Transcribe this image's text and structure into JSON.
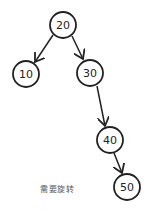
{
  "diagram": {
    "type": "binary-search-tree",
    "nodes": [
      {
        "id": "n20",
        "label": "20",
        "cx": 63,
        "cy": 25
      },
      {
        "id": "n10",
        "label": "10",
        "cx": 26,
        "cy": 74
      },
      {
        "id": "n30",
        "label": "30",
        "cx": 90,
        "cy": 73
      },
      {
        "id": "n40",
        "label": "40",
        "cx": 110,
        "cy": 140
      },
      {
        "id": "n50",
        "label": "50",
        "cx": 127,
        "cy": 187
      }
    ],
    "edges": [
      {
        "from": "20",
        "to": "10"
      },
      {
        "from": "20",
        "to": "30"
      },
      {
        "from": "30",
        "to": "40"
      },
      {
        "from": "40",
        "to": "50"
      }
    ],
    "caption": "需要旋转",
    "stroke_color": "#222222"
  }
}
